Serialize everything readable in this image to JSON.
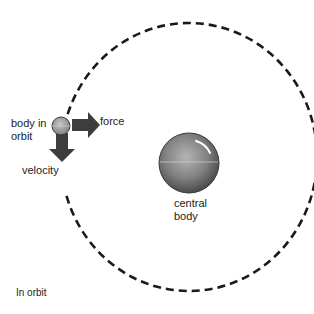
{
  "diagram": {
    "caption": "In orbit",
    "labels": {
      "body_in_orbit_line1": "body in",
      "body_in_orbit_line2": "orbit",
      "force": "force",
      "velocity": "velocity",
      "central_body_line1": "central",
      "central_body_line2": "body"
    },
    "orbit": {
      "style": "dashed",
      "cx": 189,
      "cy": 157,
      "rx": 128,
      "ry": 134
    },
    "colors": {
      "arrow": "#3d3d3d",
      "orbit": "#1a1a1a",
      "central_body": "#7a7a7a",
      "orbiting_body": "#9a9a9a"
    }
  }
}
